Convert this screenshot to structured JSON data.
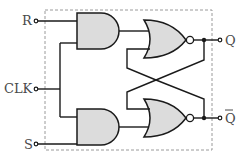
{
  "diagram": {
    "inputs": {
      "r_label": "R",
      "clk_label": "CLK",
      "s_label": "S"
    },
    "outputs": {
      "q_label": "Q",
      "qbar_label": "Q"
    },
    "gates": [
      {
        "id": "and-top",
        "type": "AND",
        "inputs": [
          "R",
          "CLK"
        ]
      },
      {
        "id": "and-bottom",
        "type": "AND",
        "inputs": [
          "CLK",
          "S"
        ]
      },
      {
        "id": "nor-top",
        "type": "NOR",
        "inputs": [
          "and-top",
          "Q̄ feedback"
        ],
        "output": "Q"
      },
      {
        "id": "nor-bottom",
        "type": "NOR",
        "inputs": [
          "Q feedback",
          "and-bottom"
        ],
        "output": "Q̄"
      }
    ],
    "colors": {
      "gate_fill": "#dcdcdc",
      "wire": "#1a1a1a",
      "border": "#9a9a9a",
      "label": "#4a4a4a"
    }
  }
}
